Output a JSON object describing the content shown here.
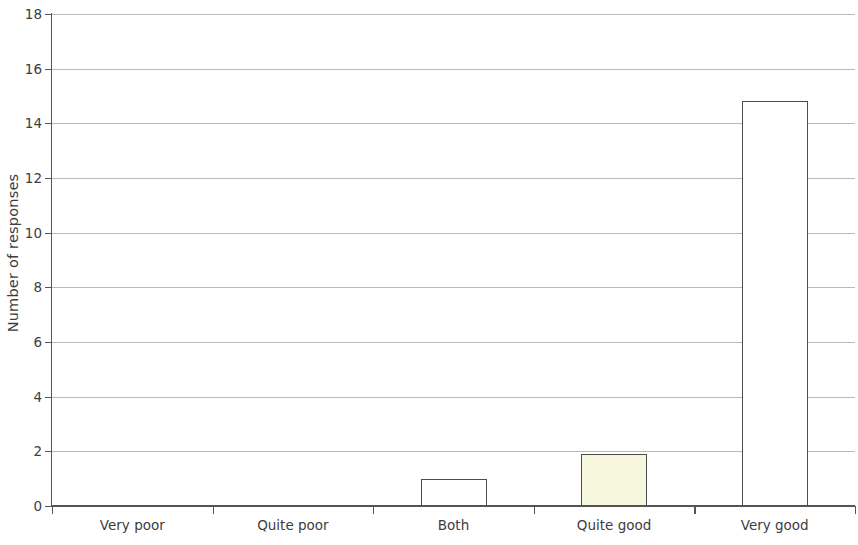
{
  "chart_data": {
    "type": "bar",
    "title": "",
    "subtitle": "",
    "xlabel": "",
    "ylabel": "Number of responses",
    "categories": [
      "Very poor",
      "Quite poor",
      "Both",
      "Quite good",
      "Very good"
    ],
    "values": [
      0,
      0,
      1,
      1.9,
      14.8
    ],
    "series": [
      {
        "name": "Number of responses",
        "values": [
          0,
          0,
          1,
          1.9,
          14.8
        ]
      }
    ],
    "bar_colors": [
      "#ffffff",
      "#ffffff",
      "#ffffff",
      "#f7f7dd",
      "#ffffff"
    ],
    "bar_border_color": "#4d4d4d",
    "ylim": [
      0,
      18
    ],
    "ytick_labels": [
      "0",
      "2",
      "4",
      "6",
      "8",
      "10",
      "12",
      "14",
      "16",
      "18"
    ],
    "ytick_values": [
      0,
      2,
      4,
      6,
      8,
      10,
      12,
      14,
      16,
      18
    ],
    "grid": true,
    "grid_axis": "y",
    "grid_color": "#b9b9b9",
    "legend": false,
    "legend_position": "none",
    "axis_color": "#555555",
    "background_color": "#ffffff"
  }
}
